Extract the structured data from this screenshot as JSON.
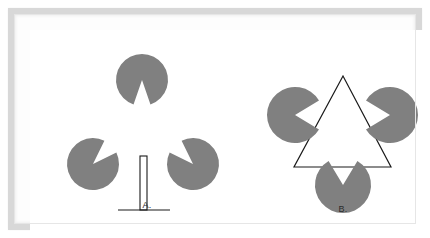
{
  "figure": {
    "background_color": "#ffffff",
    "frame_color": "#d8d8d8",
    "disc_fill_color": "#808080",
    "line_color": "#1a1a1a"
  },
  "panels": [
    {
      "id": "A",
      "label": "A.",
      "description": "Three notched discs with a thin outlined vertical bar on a baseline",
      "discs": [
        {
          "name": "top-disc",
          "cx": 112,
          "cy": 50,
          "r": 26,
          "notch_direction": "down",
          "notch_angle_deg": 38
        },
        {
          "name": "left-disc",
          "cx": 63,
          "cy": 134,
          "r": 26,
          "notch_direction": "upper-right",
          "notch_angle_deg": 38
        },
        {
          "name": "right-disc",
          "cx": 163,
          "cy": 134,
          "r": 26,
          "notch_direction": "upper-left",
          "notch_angle_deg": 38
        }
      ],
      "bar": {
        "name": "vertical-bar",
        "x": 110,
        "y": 126,
        "width": 7,
        "height": 54
      },
      "baseline": {
        "name": "baseline",
        "x1": 88,
        "x2": 140,
        "y": 180
      }
    },
    {
      "id": "B",
      "label": "B.",
      "description": "Three notched discs with an outlined triangle whose corners are occluded",
      "discs": [
        {
          "name": "left-disc",
          "cx": 65,
          "cy": 85,
          "r": 28,
          "notch_direction": "right",
          "notch_angle_deg": 62
        },
        {
          "name": "right-disc",
          "cx": 160,
          "cy": 85,
          "r": 28,
          "notch_direction": "left",
          "notch_angle_deg": 62
        },
        {
          "name": "bottom-disc",
          "cx": 113,
          "cy": 155,
          "r": 28,
          "notch_direction": "up",
          "notch_angle_deg": 62
        }
      ],
      "triangle": {
        "name": "outlined-triangle",
        "apex": {
          "x": 113,
          "y": 46
        },
        "bottom_left": {
          "x": 64,
          "y": 137
        },
        "bottom_right": {
          "x": 161,
          "y": 137
        }
      }
    }
  ]
}
